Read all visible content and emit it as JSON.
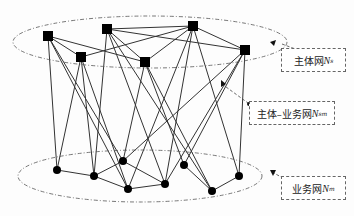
{
  "diagram": {
    "top_nodes": [
      {
        "id": "A",
        "x": 48,
        "y": 36
      },
      {
        "id": "B",
        "x": 107,
        "y": 29
      },
      {
        "id": "C",
        "x": 81,
        "y": 57
      },
      {
        "id": "D",
        "x": 145,
        "y": 62
      },
      {
        "id": "E",
        "x": 193,
        "y": 26
      },
      {
        "id": "F",
        "x": 245,
        "y": 50
      }
    ],
    "bottom_nodes": [
      {
        "id": "a",
        "x": 57,
        "y": 170
      },
      {
        "id": "b",
        "x": 94,
        "y": 176
      },
      {
        "id": "c",
        "x": 123,
        "y": 161
      },
      {
        "id": "d",
        "x": 128,
        "y": 189
      },
      {
        "id": "e",
        "x": 165,
        "y": 184
      },
      {
        "id": "f",
        "x": 184,
        "y": 165
      },
      {
        "id": "g",
        "x": 212,
        "y": 191
      },
      {
        "id": "h",
        "x": 239,
        "y": 176
      }
    ],
    "labels": {
      "subject_net": {
        "text": "主体网",
        "symbol": "N",
        "sub": "s"
      },
      "subject_business_net": {
        "text": "主体–业务网",
        "symbol": "N",
        "sub": "sm"
      },
      "business_net": {
        "text": "业务网",
        "symbol": "N",
        "sub": "m"
      }
    }
  }
}
